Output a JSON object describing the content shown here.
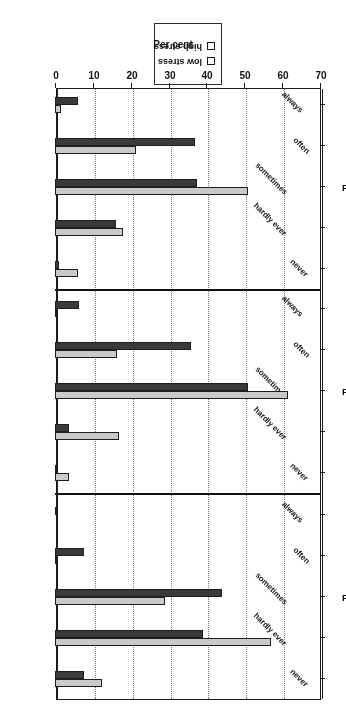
{
  "chart_data": {
    "type": "bar",
    "orientation": "horizontal",
    "title": "",
    "xlabel": "Per cent",
    "ylabel": "",
    "xlim": [
      0,
      70
    ],
    "xticks": [
      0,
      10,
      20,
      30,
      40,
      50,
      60,
      70
    ],
    "grid": true,
    "legend_position": "top-center",
    "categories": [
      "never",
      "hardly ever",
      "sometimes",
      "often",
      "always"
    ],
    "series": [
      {
        "name": "low stress",
        "color": "#c9c9c9"
      },
      {
        "name": "high stress",
        "color": "#3a3a3a"
      }
    ],
    "panels": [
      {
        "title": "Feels angry",
        "values": {
          "low stress": [
            12.5,
            57.0,
            29.0,
            0.5,
            0.0
          ],
          "high stress": [
            7.7,
            39.0,
            44.0,
            7.7,
            0.4
          ]
        }
      },
      {
        "title": "Feels drained",
        "values": {
          "low stress": [
            3.8,
            16.8,
            61.5,
            16.5,
            0.5
          ],
          "high stress": [
            0.6,
            3.8,
            51.0,
            36.0,
            6.4
          ]
        }
      },
      {
        "title": "Feels exhausted",
        "values": {
          "low stress": [
            6.0,
            18.0,
            51.0,
            21.5,
            1.5
          ],
          "high stress": [
            1.0,
            16.0,
            37.5,
            37.0,
            6.0
          ]
        }
      }
    ]
  },
  "legend": {
    "items": [
      {
        "label": "low stress",
        "color": "#c9c9c9"
      },
      {
        "label": "high stress",
        "color": "#3a3a3a"
      }
    ]
  },
  "axis": {
    "x_title": "Per cent",
    "x_tick_labels": [
      "0",
      "10",
      "20",
      "30",
      "40",
      "50",
      "60",
      "70"
    ]
  }
}
